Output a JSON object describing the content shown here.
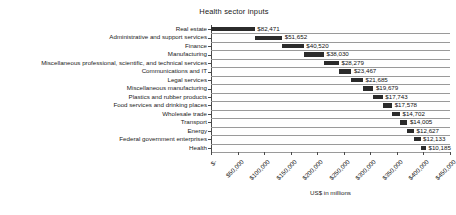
{
  "chart_data": {
    "type": "bar",
    "subtype": "waterfall",
    "title": "Health sector inputs",
    "xlabel": "US$ in millions",
    "ylabel": "",
    "orientation": "horizontal",
    "grid": true,
    "legend": null,
    "xlim": [
      0,
      450000
    ],
    "xticks": [
      0,
      50000,
      100000,
      150000,
      200000,
      250000,
      300000,
      350000,
      400000,
      450000
    ],
    "xtick_labels": [
      "$-",
      "$50,000",
      "$100,000",
      "$150,000",
      "$200,000",
      "$250,000",
      "$300,000",
      "$350,000",
      "$400,000",
      "$450,000"
    ],
    "categories": [
      "Real estate",
      "Administrative and support services",
      "Finance",
      "Manufacturing",
      "Miscellaneous professional, scientific, and technical services",
      "Communications and IT",
      "Legal services",
      "Miscellaneous manufacturing",
      "Plastics and rubber products",
      "Food services and drinking places",
      "Wholesale trade",
      "Transport",
      "Energy",
      "Federal government enterprises",
      "Health"
    ],
    "values": [
      82471,
      51652,
      40520,
      38030,
      28279,
      23467,
      21685,
      19679,
      17743,
      17578,
      14702,
      14005,
      12627,
      12133,
      10185
    ],
    "value_labels": [
      "$82,471",
      "$51,652",
      "$40,520",
      "$38,030",
      "$28,279",
      "$23,467",
      "$21,685",
      "$19,679",
      "$17,743",
      "$17,578",
      "$14,702",
      "$14,005",
      "$12,627",
      "$12,133",
      "$10,185"
    ],
    "bar_starts": [
      0,
      82471,
      134123,
      174643,
      212673,
      240952,
      264419,
      286104,
      305783,
      323526,
      341104,
      355806,
      369811,
      382438,
      394571
    ],
    "bar_color": "#2b2b2b",
    "grid_color": "#9a9a9a",
    "axis_color": "#4a4a4a"
  }
}
